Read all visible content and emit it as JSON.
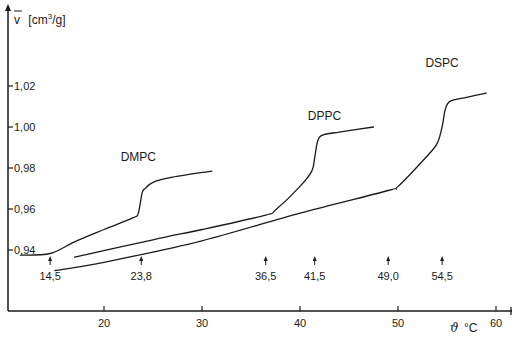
{
  "chart_data": {
    "type": "line",
    "title": "",
    "xlabel": "ϑ °C",
    "ylabel": "v̄ [cm³/g]",
    "ylabel_parts": {
      "symbol": "v",
      "unit_open": "[cm",
      "unit_sup": "3",
      "unit_close": "/g]"
    },
    "xlabel_parts": {
      "symbol": "ϑ",
      "unit": "°C"
    },
    "xlim": [
      11,
      62
    ],
    "ylim": [
      0.925,
      1.055
    ],
    "x_ticks": [
      20,
      30,
      40,
      50,
      60
    ],
    "x_tick_labels": [
      "20",
      "30",
      "40",
      "50",
      "60"
    ],
    "y_ticks": [
      0.94,
      0.96,
      0.98,
      1.0,
      1.02
    ],
    "y_tick_labels": [
      "0,94",
      "0,96",
      "0,98",
      "1,00",
      "1,02"
    ],
    "grid": false,
    "legend": "none (curves labeled directly)",
    "series": [
      {
        "name": "DMPC",
        "label_pos": {
          "x": 23.5,
          "y": 0.9835
        },
        "x": [
          11.5,
          14.5,
          17,
          20,
          23,
          23.5,
          23.9,
          24.2,
          25,
          27,
          31
        ],
        "values": [
          0.9375,
          0.9383,
          0.944,
          0.95,
          0.9558,
          0.958,
          0.968,
          0.97,
          0.973,
          0.9755,
          0.9785
        ]
      },
      {
        "name": "DPPC",
        "label_pos": {
          "x": 42.5,
          "y": 1.0035
        },
        "x": [
          17,
          25,
          30,
          36.5,
          37.5,
          40,
          41.2,
          41.5,
          41.8,
          42.3,
          44,
          47.5
        ],
        "values": [
          0.9365,
          0.945,
          0.95,
          0.957,
          0.9595,
          0.971,
          0.9785,
          0.985,
          0.993,
          0.996,
          0.9975,
          1.0
        ]
      },
      {
        "name": "DSPC",
        "label_pos": {
          "x": 54.5,
          "y": 1.0295
        },
        "x": [
          15,
          20,
          30,
          40,
          49,
          50,
          53,
          54,
          54.5,
          54.8,
          55.3,
          57,
          59
        ],
        "values": [
          0.93,
          0.934,
          0.9445,
          0.958,
          0.969,
          0.971,
          0.986,
          0.992,
          1.0,
          1.008,
          1.0125,
          1.0145,
          1.0165
        ]
      }
    ],
    "annotations": [
      {
        "type": "arrow",
        "x": 14.5,
        "label": "14,5"
      },
      {
        "type": "arrow",
        "x": 23.8,
        "label": "23,8"
      },
      {
        "type": "arrow",
        "x": 36.5,
        "label": "36,5"
      },
      {
        "type": "arrow",
        "x": 41.5,
        "label": "41,5"
      },
      {
        "type": "arrow",
        "x": 49.0,
        "label": "49,0"
      },
      {
        "type": "arrow",
        "x": 54.5,
        "label": "54,5"
      }
    ]
  }
}
